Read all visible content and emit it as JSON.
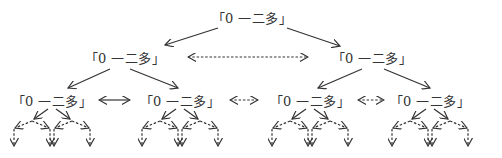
{
  "diagram": {
    "type": "binary-tree",
    "label_text": "「0 一二多」",
    "colors": {
      "line": "#333333",
      "text": "#333333",
      "background": "#ffffff"
    },
    "nodes": [
      {
        "id": "root",
        "label": "「0 一二多」",
        "x": 252,
        "y": 17,
        "level": 1
      },
      {
        "id": "l2-left",
        "label": "「0 一二多」",
        "x": 125,
        "y": 57,
        "level": 2
      },
      {
        "id": "l2-right",
        "label": "「0 一二多」",
        "x": 372,
        "y": 57,
        "level": 2
      },
      {
        "id": "l3-1",
        "label": "「0 一二多」",
        "x": 52,
        "y": 100,
        "level": 3
      },
      {
        "id": "l3-2",
        "label": "「0 一二多」",
        "x": 180,
        "y": 100,
        "level": 3
      },
      {
        "id": "l3-3",
        "label": "「0 一二多」",
        "x": 310,
        "y": 100,
        "level": 3
      },
      {
        "id": "l3-4",
        "label": "「0 一二多」",
        "x": 430,
        "y": 100,
        "level": 3
      }
    ],
    "edges": [
      {
        "from": [
          218,
          28
        ],
        "to": [
          165,
          45
        ],
        "style": "solid"
      },
      {
        "from": [
          287,
          28
        ],
        "to": [
          340,
          46
        ],
        "style": "solid"
      },
      {
        "from": [
          110,
          69
        ],
        "to": [
          68,
          88
        ],
        "style": "solid"
      },
      {
        "from": [
          130,
          69
        ],
        "to": [
          178,
          88
        ],
        "style": "solid"
      },
      {
        "from": [
          362,
          69
        ],
        "to": [
          318,
          88
        ],
        "style": "solid"
      },
      {
        "from": [
          384,
          69
        ],
        "to": [
          430,
          88
        ],
        "style": "solid"
      }
    ],
    "sibling_links": [
      {
        "from": [
          188,
          57
        ],
        "to": [
          308,
          57
        ],
        "style": "dashed",
        "bidirectional": true
      },
      {
        "from": [
          99,
          100
        ],
        "to": [
          130,
          100
        ],
        "style": "solid",
        "bidirectional": true
      },
      {
        "from": [
          230,
          100
        ],
        "to": [
          258,
          100
        ],
        "style": "dashed",
        "bidirectional": true
      },
      {
        "from": [
          358,
          100
        ],
        "to": [
          384,
          100
        ],
        "style": "dashed",
        "bidirectional": true
      }
    ],
    "subtrees": [
      {
        "cx": 52
      },
      {
        "cx": 180
      },
      {
        "cx": 310
      },
      {
        "cx": 430
      }
    ]
  }
}
